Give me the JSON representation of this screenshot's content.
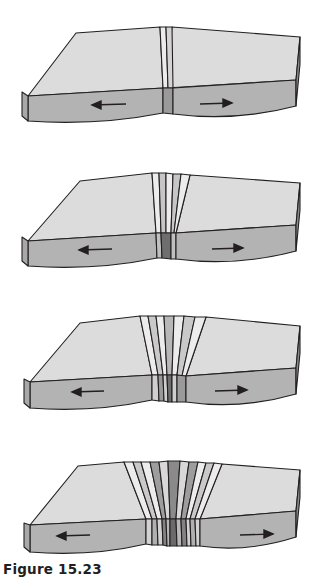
{
  "figure": {
    "caption": "Figure 15.23",
    "background_color": "#ffffff",
    "stage_count": 4
  },
  "palette": {
    "outline": "#231f20",
    "top_base": "#d9d9d9",
    "top_highlight": "#e6e6e6",
    "side_front": "#b3b3b3",
    "side_right": "#8c8c8c",
    "stripe_light": "#e8e8e8",
    "stripe_mid": "#bfbfbf",
    "stripe_dark": "#8f8f8f",
    "stripe_darkest": "#707070",
    "rift_face": "#9a9a9a",
    "rift_face_dark": "#6e6e6e",
    "arrow_color": "#231f20"
  },
  "panels": [
    {
      "id": "stage-1",
      "label": "Stage 1",
      "description": "Single narrow band of new crust at the spreading ridge; plates begin to diverge.",
      "top_y": 0,
      "stripes_per_side": 1,
      "left_arrow": {
        "name": "left-arrow",
        "direction": "left",
        "label": "←"
      },
      "right_arrow": {
        "name": "right-arrow",
        "direction": "right",
        "label": "→"
      }
    },
    {
      "id": "stage-2",
      "label": "Stage 2",
      "description": "A second pair of magnetic bands has formed as spreading continues.",
      "top_y": 145,
      "stripes_per_side": 2,
      "left_arrow": {
        "name": "left-arrow",
        "direction": "left",
        "label": "←"
      },
      "right_arrow": {
        "name": "right-arrow",
        "direction": "right",
        "label": "→"
      }
    },
    {
      "id": "stage-3",
      "label": "Stage 3",
      "description": "Three pairs of alternating normal and reversed polarity stripes flank the ridge.",
      "top_y": 290,
      "stripes_per_side": 3,
      "left_arrow": {
        "name": "left-arrow",
        "direction": "left",
        "label": "←"
      },
      "right_arrow": {
        "name": "right-arrow",
        "direction": "right",
        "label": "→"
      }
    },
    {
      "id": "stage-4",
      "label": "Stage 4",
      "description": "A wide symmetric pattern of magnetic stripes records the full spreading history.",
      "top_y": 435,
      "stripes_per_side": 5,
      "left_arrow": {
        "name": "left-arrow",
        "direction": "left",
        "label": "←"
      },
      "right_arrow": {
        "name": "right-arrow",
        "direction": "right",
        "label": "→"
      }
    }
  ]
}
